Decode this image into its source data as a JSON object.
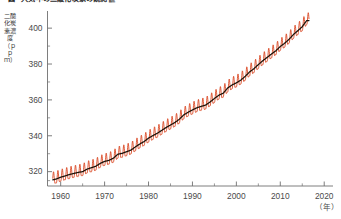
{
  "figure": {
    "marker": "図",
    "title": "大気中の二酸化炭素の観測値",
    "background": "#ffffff"
  },
  "colors": {
    "seasonal_line": "#d8401a",
    "trend_line": "#1a1208",
    "axis": "#6f6f6f",
    "tick_label": "#4a4a4a",
    "title_text": "#2b2b2b"
  },
  "axes": {
    "y": {
      "title": "二酸化炭素濃度（ｐｐｍ）",
      "unit": "ppm",
      "ticks": [
        400,
        380,
        360,
        340,
        320
      ],
      "tick_labels": [
        "400",
        "380",
        "360",
        "340",
        "320"
      ],
      "minor_ticks": [
        410,
        390,
        370,
        350,
        330,
        315
      ],
      "min": 312,
      "max": 409
    },
    "x": {
      "title": "（年）",
      "ticks": [
        1960,
        1970,
        1980,
        1990,
        2000,
        2010,
        2020
      ],
      "tick_labels": [
        "1960",
        "1970",
        "1980",
        "1990",
        "2000",
        "2010",
        "2020"
      ],
      "minor_step": 5,
      "min": 1957,
      "max": 2022
    }
  },
  "chart_data": {
    "type": "line",
    "title": "大気中の二酸化炭素の観測値",
    "xlabel": "（年）",
    "ylabel": "二酸化炭素濃度（ppm）",
    "xlim": [
      1957,
      2022
    ],
    "ylim": [
      312,
      409
    ],
    "grid": false,
    "legend": null,
    "series": [
      {
        "name": "月別値（季節変動を含む）",
        "color": "#d8401a",
        "seasonal_amplitude_ppm": 3.2,
        "note": "monthly mean with seasonal cycle, peak in May, minimum in September"
      },
      {
        "name": "長期変動傾向（トレンド）",
        "color": "#1a1208",
        "x": [
          1958,
          1959,
          1960,
          1961,
          1962,
          1963,
          1964,
          1965,
          1966,
          1967,
          1968,
          1969,
          1970,
          1971,
          1972,
          1973,
          1974,
          1975,
          1976,
          1977,
          1978,
          1979,
          1980,
          1981,
          1982,
          1983,
          1984,
          1985,
          1986,
          1987,
          1988,
          1989,
          1990,
          1991,
          1992,
          1993,
          1994,
          1995,
          1996,
          1997,
          1998,
          1999,
          2000,
          2001,
          2002,
          2003,
          2004,
          2005,
          2006,
          2007,
          2008,
          2009,
          2010,
          2011,
          2012,
          2013,
          2014,
          2015,
          2016
        ],
        "values": [
          315.3,
          315.9,
          316.9,
          317.6,
          318.4,
          319.0,
          319.6,
          320.0,
          321.4,
          322.2,
          323.0,
          324.6,
          325.7,
          326.3,
          327.5,
          329.7,
          330.2,
          331.1,
          332.0,
          333.8,
          335.4,
          336.8,
          338.7,
          340.1,
          341.4,
          343.0,
          344.6,
          346.0,
          347.4,
          349.2,
          351.6,
          353.1,
          354.4,
          355.6,
          356.4,
          357.1,
          358.8,
          360.8,
          362.6,
          363.7,
          366.6,
          368.3,
          369.5,
          371.0,
          373.1,
          375.6,
          377.4,
          379.7,
          381.8,
          383.7,
          385.6,
          387.4,
          389.8,
          391.6,
          393.8,
          396.5,
          398.6,
          400.8,
          404.2
        ]
      }
    ]
  }
}
